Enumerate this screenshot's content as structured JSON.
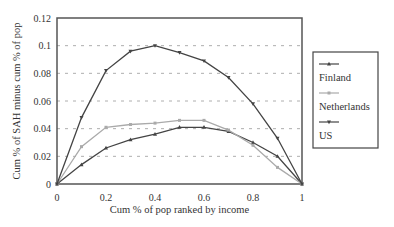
{
  "chart_data": {
    "type": "line",
    "title": "",
    "xlabel": "Cum % of pop ranked by income",
    "ylabel": "Cum % of SAH minus cum % of pop",
    "xlim": [
      0,
      1
    ],
    "ylim": [
      0,
      0.12
    ],
    "x_ticks": [
      "0",
      "0.2",
      "0.4",
      "0.6",
      "0.8",
      "1"
    ],
    "y_ticks": [
      "0",
      "0.02",
      "0.04",
      "0.06",
      "0.08",
      "0.1",
      "0.12"
    ],
    "grid": "horizontal-dashed",
    "legend_position": "right",
    "x": [
      0,
      0.1,
      0.2,
      0.3,
      0.4,
      0.5,
      0.6,
      0.7,
      0.8,
      0.9,
      1.0
    ],
    "series": [
      {
        "name": "Finland",
        "color": "#444444",
        "marker": "triangle-up",
        "values": [
          0,
          0.014,
          0.026,
          0.032,
          0.036,
          0.041,
          0.041,
          0.038,
          0.03,
          0.02,
          0
        ]
      },
      {
        "name": "Netherlands",
        "color": "#aaaaaa",
        "marker": "square",
        "values": [
          0,
          0.027,
          0.041,
          0.043,
          0.044,
          0.046,
          0.046,
          0.039,
          0.028,
          0.012,
          0
        ]
      },
      {
        "name": "US",
        "color": "#444444",
        "marker": "triangle-down",
        "values": [
          0,
          0.048,
          0.082,
          0.096,
          0.1,
          0.095,
          0.089,
          0.077,
          0.058,
          0.033,
          0
        ]
      }
    ]
  }
}
